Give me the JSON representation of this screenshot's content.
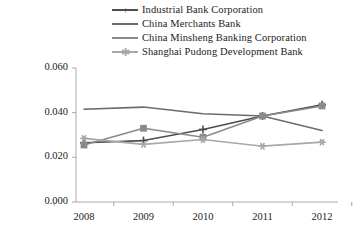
{
  "legend": {
    "position": "top",
    "items": [
      {
        "label": "Industrial Bank Corporation",
        "color": "#4d4d4d",
        "marker": "plus"
      },
      {
        "label": "China Merchants Bank",
        "color": "#6b6b6b",
        "marker": "none"
      },
      {
        "label": "China Minsheng Banking Corporation",
        "color": "#8a8a8a",
        "marker": "square"
      },
      {
        "label": "Shanghai Pudong Development Bank",
        "color": "#a8a8a8",
        "marker": "asterisk"
      }
    ]
  },
  "axes": {
    "y_ticks": [
      "0.000",
      "0.020",
      "0.040",
      "0.060"
    ],
    "x_ticks": [
      "2008",
      "2009",
      "2010",
      "2011",
      "2012"
    ]
  },
  "chart_data": {
    "type": "line",
    "title": "",
    "subtitle": "",
    "xlabel": "",
    "ylabel": "",
    "x": [
      2008,
      2009,
      2010,
      2011,
      2012
    ],
    "categories": [
      "2008",
      "2009",
      "2010",
      "2011",
      "2012"
    ],
    "ylim": [
      0.0,
      0.06
    ],
    "yticks": [
      0.0,
      0.02,
      0.04,
      0.06
    ],
    "grid": false,
    "legend_position": "top",
    "series": [
      {
        "name": "Industrial Bank Corporation",
        "color": "#4d4d4d",
        "marker": "plus",
        "values": [
          0.0265,
          0.0275,
          0.0325,
          0.0385,
          0.0435
        ]
      },
      {
        "name": "China Merchants Bank",
        "color": "#6b6b6b",
        "marker": "none",
        "values": [
          0.0415,
          0.0425,
          0.0395,
          0.0385,
          0.032
        ]
      },
      {
        "name": "China Minsheng Banking Corporation",
        "color": "#8a8a8a",
        "marker": "square",
        "values": [
          0.0255,
          0.033,
          0.029,
          0.0385,
          0.043
        ]
      },
      {
        "name": "Shanghai Pudong Development Bank",
        "color": "#a8a8a8",
        "marker": "asterisk",
        "values": [
          0.0285,
          0.0258,
          0.028,
          0.025,
          0.0268
        ]
      }
    ]
  }
}
